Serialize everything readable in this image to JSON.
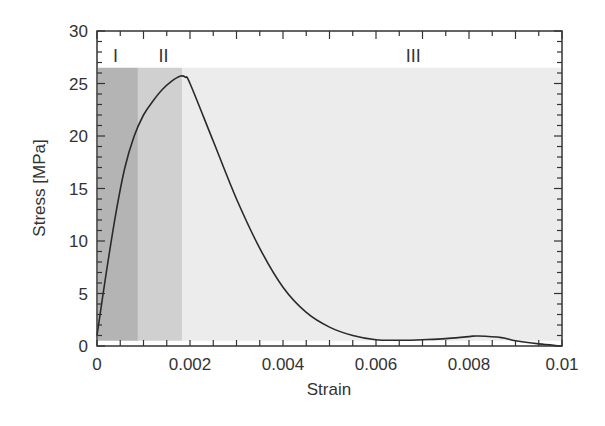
{
  "chart_data": {
    "type": "line",
    "title": "",
    "xlabel": "Strain",
    "ylabel": "Stress [MPa]",
    "xlim": [
      0,
      0.01
    ],
    "ylim": [
      0,
      30
    ],
    "grid": false,
    "legend": null,
    "x_ticks": [
      0,
      0.002,
      0.004,
      0.006,
      0.008,
      0.01
    ],
    "x_tick_labels": [
      "0",
      "0.002",
      "0.004",
      "0.006",
      "0.008",
      "0.01"
    ],
    "y_ticks": [
      0,
      5,
      10,
      15,
      20,
      25,
      30
    ],
    "y_tick_labels": [
      "0",
      "5",
      "10",
      "15",
      "20",
      "25",
      "30"
    ],
    "series": [
      {
        "name": "stress-strain",
        "color": "#2a2a2a",
        "x": [
          0,
          0.0002,
          0.0004,
          0.0006,
          0.0008,
          0.001,
          0.0012,
          0.0014,
          0.0016,
          0.0018,
          0.0019,
          0.002,
          0.0025,
          0.003,
          0.0035,
          0.004,
          0.0045,
          0.005,
          0.0055,
          0.006,
          0.0065,
          0.007,
          0.0075,
          0.008,
          0.0082,
          0.0087,
          0.009,
          0.0095,
          0.01
        ],
        "y": [
          1.0,
          7.0,
          12.5,
          17.0,
          20.0,
          22.0,
          23.3,
          24.4,
          25.2,
          25.7,
          25.6,
          25.0,
          19.5,
          14.0,
          9.3,
          5.6,
          3.2,
          1.8,
          1.0,
          0.6,
          0.55,
          0.6,
          0.7,
          0.9,
          0.95,
          0.8,
          0.5,
          0.2,
          0.0
        ]
      }
    ],
    "regions": [
      {
        "label": "I",
        "x_start": 0,
        "x_end": 0.00088,
        "y_top": 26.5,
        "color": "#b4b4b4",
        "label_x": 0.0004
      },
      {
        "label": "II",
        "x_start": 0.00088,
        "x_end": 0.00183,
        "y_top": 26.5,
        "color": "#d0d0d0",
        "label_x": 0.00143
      },
      {
        "label": "III",
        "x_start": 0.00183,
        "x_end": 0.01,
        "y_top": 26.5,
        "color": "#ececec",
        "label_x": 0.0068
      }
    ],
    "annotations": [
      "I",
      "II",
      "III"
    ]
  }
}
